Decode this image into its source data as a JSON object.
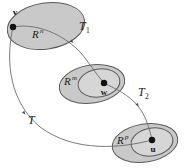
{
  "figure": {
    "kind": "math-diagram",
    "background_color": "#ffffff",
    "stroke_color": "#5a5a5a",
    "ellipse_fill": "#c9c9c9",
    "inner_ellipse_fill": "#d6d6d6",
    "text_color": "#1a1a1a"
  },
  "sets": [
    {
      "id": "domain",
      "base": "R",
      "exponent": "n",
      "label_full": "R^n",
      "has_inner": false
    },
    {
      "id": "middle",
      "base": "R",
      "exponent": "m",
      "label_full": "R^m",
      "has_inner": true
    },
    {
      "id": "codomain",
      "base": "R",
      "exponent": "p",
      "label_full": "R^p",
      "has_inner": true
    }
  ],
  "points": [
    {
      "id": "v",
      "label": "v",
      "in_set": "domain"
    },
    {
      "id": "w",
      "label": "w",
      "in_set": "middle"
    },
    {
      "id": "u",
      "label": "u",
      "in_set": "codomain"
    }
  ],
  "maps": [
    {
      "id": "T1",
      "base": "T",
      "subscript": "1",
      "label_full": "T1",
      "from": "v",
      "to": "w"
    },
    {
      "id": "T2",
      "base": "T",
      "subscript": "2",
      "label_full": "T2",
      "from": "w",
      "to": "u"
    },
    {
      "id": "T",
      "base": "T",
      "subscript": "",
      "label_full": "T",
      "from": "v",
      "to": "u"
    }
  ]
}
